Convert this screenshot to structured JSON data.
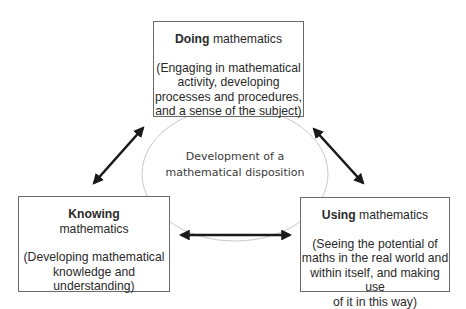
{
  "diagram": {
    "center": {
      "line1": "Development of a",
      "line2": "mathematical disposition"
    },
    "nodes": {
      "doing": {
        "bold": "Doing",
        "rest": " mathematics",
        "desc_lines": [
          "(Engaging in mathematical",
          "activity, developing",
          "processes and procedures,",
          "and a sense of the subject)"
        ]
      },
      "knowing": {
        "bold": "Knowing",
        "rest": "mathematics",
        "desc_lines": [
          "(Developing mathematical",
          "knowledge and",
          "understanding)"
        ]
      },
      "using": {
        "bold": "Using",
        "rest": " mathematics",
        "desc_lines": [
          "(Seeing the potential of",
          "maths in the real world and",
          "within itself, and making use",
          "of it in this way)"
        ]
      }
    },
    "arrows": [
      {
        "from": "doing",
        "to": "knowing",
        "type": "bidirectional"
      },
      {
        "from": "doing",
        "to": "using",
        "type": "bidirectional"
      },
      {
        "from": "knowing",
        "to": "using",
        "type": "bidirectional"
      }
    ],
    "colors": {
      "arrow": "#1a1a1a",
      "box_border": "#6a6a6a",
      "ellipse": "#c8c8c8"
    }
  }
}
